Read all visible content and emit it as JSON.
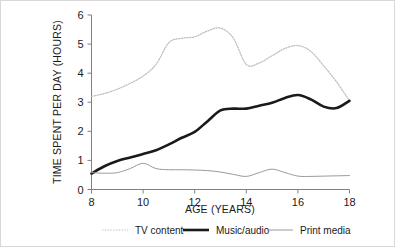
{
  "chart_data": {
    "type": "line",
    "title": "",
    "xlabel": "AGE (YEARS)",
    "ylabel": "TIME SPENT PER DAY (HOURS)",
    "xlim": [
      8,
      18
    ],
    "ylim": [
      0,
      6
    ],
    "xticks": [
      8,
      10,
      12,
      14,
      16,
      18
    ],
    "yticks": [
      0,
      1,
      2,
      3,
      4,
      5,
      6
    ],
    "grid": false,
    "legend_position": "bottom",
    "x": [
      8,
      8.5,
      9,
      9.5,
      10,
      10.5,
      11,
      11.5,
      12,
      12.5,
      13,
      13.5,
      14,
      14.5,
      15,
      15.5,
      16,
      16.5,
      17,
      17.5,
      18
    ],
    "series": [
      {
        "name": "TV content",
        "style": "dotted",
        "color": "#bdbdbd",
        "width": 1.2,
        "values": [
          3.2,
          3.3,
          3.45,
          3.65,
          3.9,
          4.3,
          5.05,
          5.2,
          5.25,
          5.45,
          5.55,
          5.2,
          4.3,
          4.35,
          4.6,
          4.85,
          4.95,
          4.75,
          4.25,
          3.7,
          3.05
        ]
      },
      {
        "name": "Music/audio",
        "style": "solid",
        "color": "#1a1a1a",
        "width": 2.6,
        "values": [
          0.55,
          0.8,
          0.98,
          1.1,
          1.22,
          1.35,
          1.55,
          1.78,
          1.98,
          2.35,
          2.72,
          2.78,
          2.78,
          2.88,
          2.98,
          3.15,
          3.25,
          3.1,
          2.85,
          2.8,
          3.05
        ]
      },
      {
        "name": "Print media",
        "style": "solid",
        "color": "#9a9a9a",
        "width": 1.0,
        "values": [
          0.58,
          0.56,
          0.58,
          0.72,
          0.9,
          0.72,
          0.68,
          0.68,
          0.67,
          0.65,
          0.6,
          0.52,
          0.45,
          0.58,
          0.7,
          0.58,
          0.46,
          0.45,
          0.46,
          0.47,
          0.48
        ]
      }
    ]
  },
  "legend": {
    "items": [
      {
        "label": "TV content"
      },
      {
        "label": "Music/audio"
      },
      {
        "label": "Print media"
      }
    ]
  },
  "axes": {
    "x_title": "AGE (YEARS)",
    "y_title": "TIME SPENT PER DAY (HOURS)",
    "x_tick_labels": [
      "8",
      "10",
      "12",
      "14",
      "16",
      "18"
    ],
    "y_tick_labels": [
      "0",
      "1",
      "2",
      "3",
      "4",
      "5",
      "6"
    ]
  }
}
